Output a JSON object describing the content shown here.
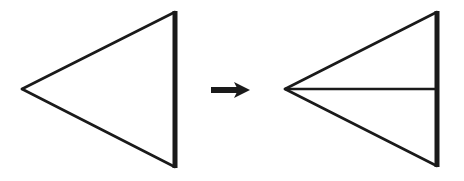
{
  "diagram": {
    "description": "Triangle with a thick vertical edge transforms into the same triangle split by a horizontal median line",
    "colors": {
      "stroke": "#1a1a1a",
      "background": "#ffffff"
    },
    "left_triangle": {
      "label": "original triangle",
      "tip": [
        22,
        89
      ],
      "top": [
        175,
        12
      ],
      "bottom": [
        175,
        167
      ],
      "thick_edge": "right vertical edge"
    },
    "arrow": {
      "label": "transforms into",
      "direction": "right",
      "from": [
        211,
        90
      ],
      "to": [
        249,
        90
      ]
    },
    "right_triangle": {
      "label": "triangle with median",
      "tip": [
        285,
        89
      ],
      "top": [
        437,
        12
      ],
      "bottom": [
        437,
        166
      ],
      "median_end": [
        437,
        89
      ],
      "thick_edge": "right vertical edge"
    }
  }
}
